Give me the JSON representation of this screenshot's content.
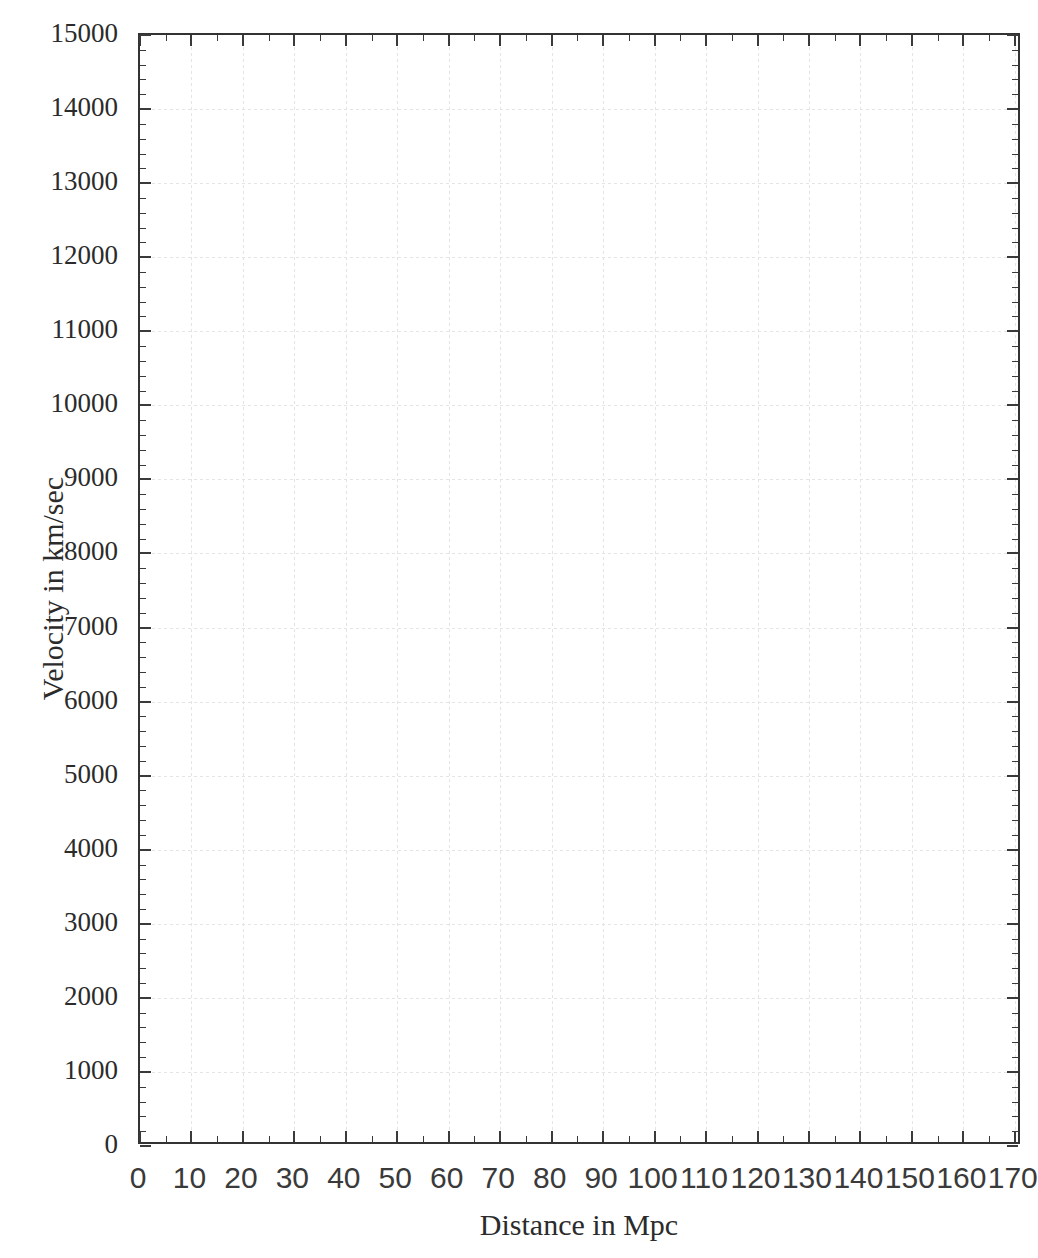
{
  "chart_data": {
    "type": "scatter",
    "title": "",
    "subtitle": "",
    "xlabel": "Distance in Mpc",
    "ylabel": "Velocity in km/sec",
    "xlim": [
      0,
      171.4
    ],
    "ylim": [
      0,
      15000
    ],
    "x_major_tick_step": 10,
    "x_minor_tick_step": 5,
    "y_major_tick_step": 1000,
    "y_minor_tick_step": 200,
    "x_tick_labels": [
      "0",
      "10",
      "20",
      "30",
      "40",
      "50",
      "60",
      "70",
      "80",
      "90",
      "100",
      "110",
      "120",
      "130",
      "140",
      "150",
      "160",
      "170"
    ],
    "x_tick_values": [
      0,
      10,
      20,
      30,
      40,
      50,
      60,
      70,
      80,
      90,
      100,
      110,
      120,
      130,
      140,
      150,
      160,
      170
    ],
    "y_tick_labels": [
      "0",
      "1000",
      "2000",
      "3000",
      "4000",
      "5000",
      "6000",
      "7000",
      "8000",
      "9000",
      "10000",
      "11000",
      "12000",
      "13000",
      "14000",
      "15000"
    ],
    "y_tick_values": [
      0,
      1000,
      2000,
      3000,
      4000,
      5000,
      6000,
      7000,
      8000,
      9000,
      10000,
      11000,
      12000,
      13000,
      14000,
      15000
    ],
    "grid": true,
    "grid_color": "#e4e4e4",
    "axis_color": "#333333",
    "background_color": "#ffffff",
    "legend": null,
    "legend_position": "none",
    "series": [],
    "x": [],
    "values": [],
    "annotations": []
  },
  "axes": {
    "x_title": "Distance in Mpc",
    "y_title": "Velocity in km/sec"
  }
}
